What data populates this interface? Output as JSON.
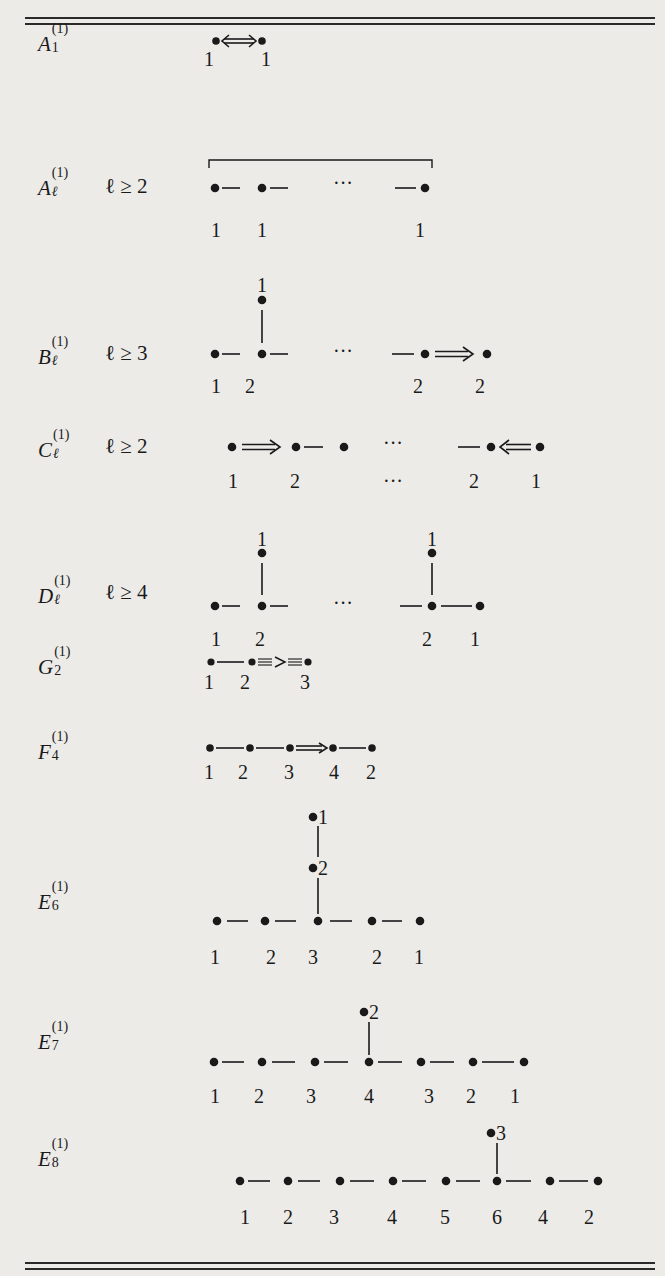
{
  "diagrams": [
    {
      "type": "A",
      "rank": "1",
      "condition": "",
      "marks": [
        "1",
        "1"
      ],
      "bond": "double-headed quadruple arrow"
    },
    {
      "type": "A",
      "rank": "ℓ",
      "condition": "ℓ ≥ 2",
      "marks": [
        "1",
        "1",
        "1"
      ],
      "ellipsis": "···"
    },
    {
      "type": "B",
      "rank": "ℓ",
      "condition": "ℓ ≥ 3",
      "top_mark": "1",
      "marks": [
        "1",
        "2",
        "2",
        "2"
      ],
      "ellipsis": "···"
    },
    {
      "type": "C",
      "rank": "ℓ",
      "condition": "ℓ ≥ 2",
      "marks": [
        "1",
        "2",
        "···",
        "2",
        "1"
      ],
      "ellipsis": "···"
    },
    {
      "type": "D",
      "rank": "ℓ",
      "condition": "ℓ ≥ 4",
      "top_marks": [
        "1",
        "1"
      ],
      "marks": [
        "1",
        "2",
        "2",
        "1"
      ],
      "ellipsis": "···"
    },
    {
      "type": "G",
      "rank": "2",
      "condition": "",
      "marks": [
        "1",
        "2",
        "3"
      ]
    },
    {
      "type": "F",
      "rank": "4",
      "condition": "",
      "marks": [
        "1",
        "2",
        "3",
        "4",
        "2"
      ]
    },
    {
      "type": "E",
      "rank": "6",
      "condition": "",
      "branch_marks": [
        "1",
        "2"
      ],
      "marks": [
        "1",
        "2",
        "3",
        "2",
        "1"
      ]
    },
    {
      "type": "E",
      "rank": "7",
      "condition": "",
      "branch_marks": [
        "2"
      ],
      "marks": [
        "1",
        "2",
        "3",
        "4",
        "3",
        "2",
        "1"
      ]
    },
    {
      "type": "E",
      "rank": "8",
      "condition": "",
      "branch_marks": [
        "3"
      ],
      "marks": [
        "1",
        "2",
        "3",
        "4",
        "5",
        "6",
        "4",
        "2"
      ]
    }
  ],
  "superscript": "(1)",
  "ellipsis": "···"
}
